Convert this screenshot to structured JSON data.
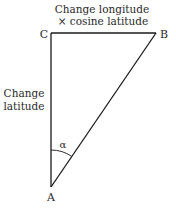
{
  "diagram": {
    "type": "right-triangle",
    "vertices": {
      "A": {
        "label": "A",
        "x": 51,
        "y": 187
      },
      "B": {
        "label": "B",
        "x": 156,
        "y": 33
      },
      "C": {
        "label": "C",
        "x": 51,
        "y": 33
      }
    },
    "edges": {
      "top": {
        "from": "C",
        "to": "B",
        "label_line1": "Change longitude",
        "label_line2": "× cosine latitude"
      },
      "left": {
        "from": "C",
        "to": "A",
        "label_line1": "Change",
        "label_line2": "latitude"
      },
      "hypotenuse": {
        "from": "A",
        "to": "B"
      }
    },
    "angle": {
      "vertex": "A",
      "symbol": "α"
    },
    "colors": {
      "line": "#1a1a1a",
      "text": "#2a2a2a",
      "background": "#ffffff"
    }
  }
}
